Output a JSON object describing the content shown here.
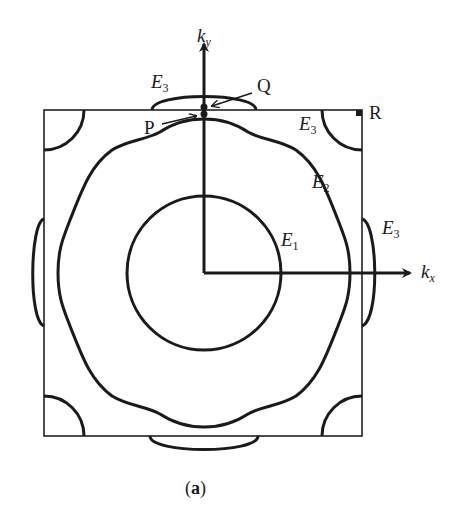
{
  "figure": {
    "caption_open": "(",
    "caption_letter": "a",
    "caption_close": ")",
    "colors": {
      "stroke": "#1a1a1a",
      "background": "#ffffff"
    },
    "axes": {
      "x": {
        "symbol": "k",
        "subscript": "x"
      },
      "y": {
        "symbol": "k",
        "subscript": "y"
      }
    },
    "curves": [
      {
        "label_symbol": "E",
        "label_sub": "1",
        "shape": "circle"
      },
      {
        "label_symbol": "E",
        "label_sub": "2",
        "shape": "rounded-square-contour"
      },
      {
        "label_symbol": "E",
        "label_sub": "3",
        "shape": "edge-pockets"
      }
    ],
    "e3_labels": [
      {
        "symbol": "E",
        "sub": "3"
      },
      {
        "symbol": "E",
        "sub": "3"
      },
      {
        "symbol": "E",
        "sub": "3"
      }
    ],
    "points": [
      {
        "name": "P"
      },
      {
        "name": "Q"
      },
      {
        "name": "R"
      }
    ]
  }
}
